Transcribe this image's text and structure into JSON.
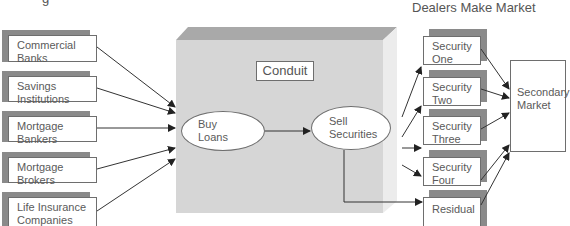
{
  "title_left_partial": "g",
  "title_right": "Dealers Make Market",
  "originators": [
    {
      "line1": "Commercial",
      "line2": "Banks"
    },
    {
      "line1": "Savings",
      "line2": "Institutions"
    },
    {
      "line1": "Mortgage",
      "line2": "Bankers"
    },
    {
      "line1": "Mortgage",
      "line2": "Brokers"
    },
    {
      "line1": "Life Insurance",
      "line2": "Companies"
    }
  ],
  "conduit": {
    "label": "Conduit",
    "buy": {
      "line1": "Buy",
      "line2": "Loans"
    },
    "sell": {
      "line1": "Sell",
      "line2": "Securities"
    }
  },
  "securities": [
    {
      "line1": "Security",
      "line2": "One"
    },
    {
      "line1": "Security",
      "line2": "Two"
    },
    {
      "line1": "Security",
      "line2": "Three"
    },
    {
      "line1": "Security",
      "line2": "Four"
    },
    {
      "line1": "Residual",
      "line2": ""
    }
  ],
  "secondary_market": {
    "line1": "Secondary",
    "line2": "Market"
  },
  "colors": {
    "conduit_front": "#d6d6d6",
    "conduit_top": "#a9a9a9",
    "conduit_side": "#ececec",
    "shadow": "#8a8a8a",
    "line": "#333333"
  }
}
